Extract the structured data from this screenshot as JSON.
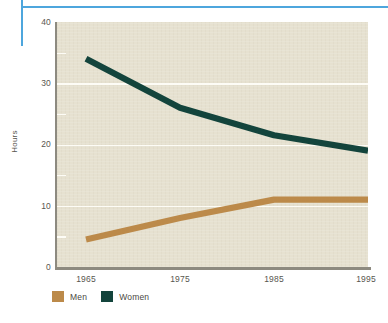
{
  "chart_data": {
    "type": "line",
    "title": "",
    "subtitle": "",
    "xlabel": "",
    "ylabel": "Hours",
    "x": [
      1965,
      1975,
      1985,
      1995
    ],
    "categories": [
      "1965",
      "1975",
      "1985",
      "1995"
    ],
    "series": [
      {
        "name": "Men",
        "color": "#bc8a4a",
        "values": [
          4.5,
          8,
          11,
          11
        ]
      },
      {
        "name": "Women",
        "color": "#13443c",
        "values": [
          34,
          26,
          21.5,
          19
        ]
      }
    ],
    "ylim": [
      0,
      40
    ],
    "xlim": [
      1965,
      1995
    ],
    "yticks": [
      0,
      10,
      20,
      30,
      40
    ],
    "yticks_minor": [
      5,
      15,
      25,
      35
    ],
    "xticks": [
      "1965",
      "1975",
      "1985",
      "1995"
    ],
    "grid": true,
    "legend_position": "bottom-left",
    "plot_background": "#e6e1d0",
    "accent_rule_color": "#4da6dd"
  },
  "axes": {
    "y_title": "Hours",
    "y_tick_labels": [
      "40",
      "30",
      "20",
      "10",
      "0"
    ],
    "x_tick_labels": [
      "1965",
      "1975",
      "1985",
      "1995"
    ]
  },
  "legend": {
    "items": [
      {
        "label": "Men",
        "color": "#bc8a4a"
      },
      {
        "label": "Women",
        "color": "#13443c"
      }
    ]
  }
}
